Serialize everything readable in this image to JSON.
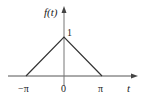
{
  "diagram": {
    "type": "triangle-function-plot",
    "y_axis_label": "f(t)",
    "x_axis_label": "t",
    "peak_label": "1",
    "x_ticks": [
      {
        "label": "−π",
        "value": -3.14159
      },
      {
        "label": "0",
        "value": 0
      },
      {
        "label": "π",
        "value": 3.14159
      }
    ],
    "points": [
      {
        "t": "-π",
        "f": 0
      },
      {
        "t": "0",
        "f": 1
      },
      {
        "t": "π",
        "f": 0
      }
    ],
    "colors": {
      "curve": "#333333",
      "axis": "#555555",
      "text": "#222222"
    }
  }
}
